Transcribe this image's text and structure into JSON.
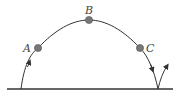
{
  "diagram": {
    "type": "projectile-trajectory",
    "colors": {
      "line": "#333333",
      "dot": "#777777",
      "dot_stroke": "#555555",
      "label": "#444444"
    },
    "points": [
      {
        "id": "A",
        "label": "A",
        "x": 38,
        "y": 48
      },
      {
        "id": "B",
        "label": "B",
        "x": 89,
        "y": 20
      },
      {
        "id": "C",
        "label": "C",
        "x": 140,
        "y": 48
      }
    ],
    "ground": {
      "x1": 7,
      "x2": 173,
      "y": 89
    },
    "launch": {
      "x": 21,
      "y": 89
    },
    "landing": {
      "x": 158,
      "y": 89
    },
    "bounce_tip": {
      "x": 167,
      "y": 66
    }
  }
}
